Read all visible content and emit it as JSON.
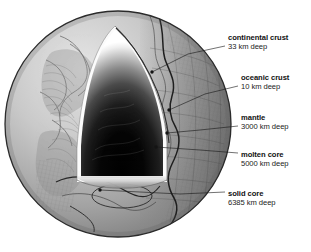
{
  "figure": {
    "background_color": "#ffffff",
    "ink_color": "#111111"
  },
  "globe": {
    "name": "earth-globe",
    "center_x": 118,
    "center_y": 124,
    "radius": 113,
    "surface_color_light": "#d8d8d8",
    "surface_color_mid": "#9a9a9a",
    "surface_color_dark": "#6a6a6a",
    "outline_color": "#2b2b2b"
  },
  "cutaway": {
    "name": "wedge-cutaway",
    "apex_x": 115,
    "apex_y": 30,
    "base_y": 178,
    "left_x": 80,
    "right_x": 163,
    "rim_color": "#f4f4f4",
    "core_color": "#000000"
  },
  "labels": [
    {
      "id": "continental-crust",
      "title": "continental crust",
      "subtitle": "33 km deep",
      "title_x": 228,
      "title_y": 40,
      "sub_y": 49,
      "leader": "M225,46 L188,54 L152,72",
      "dot_x": 152,
      "dot_y": 72
    },
    {
      "id": "oceanic-crust",
      "title": "oceanic crust",
      "subtitle": "10 km deep",
      "title_x": 241,
      "title_y": 80,
      "sub_y": 89,
      "leader": "M238,86 L205,94 L169,110",
      "dot_x": 169,
      "dot_y": 110
    },
    {
      "id": "mantle",
      "title": "mantle",
      "subtitle": "3000 km deep",
      "title_x": 241,
      "title_y": 120,
      "sub_y": 129,
      "leader": "M238,126 L200,130 L167,133",
      "dot_x": 167,
      "dot_y": 133
    },
    {
      "id": "molten-core",
      "title": "molten core",
      "subtitle": "5000 km deep",
      "title_x": 241,
      "title_y": 157,
      "sub_y": 166,
      "leader": "M238,153 L200,150 L156,147",
      "dot_x": 156,
      "dot_y": 147
    },
    {
      "id": "solid-core",
      "title": "solid core",
      "subtitle": "6385 km deep",
      "title_x": 228,
      "title_y": 196,
      "sub_y": 205,
      "leader": "M225,192 L180,194 L120,191 L100,190",
      "dot_x": 100,
      "dot_y": 190
    }
  ]
}
